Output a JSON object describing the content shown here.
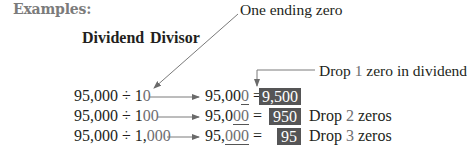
{
  "heading": "Examples:",
  "columns": {
    "dividend": "Dividend",
    "divisor": "Divisor"
  },
  "annotations": {
    "one_ending_zero": "One ending zero",
    "drop_one_prefix": "Drop ",
    "drop_one_number": "1",
    "drop_one_suffix": " zero in dividend"
  },
  "rows": [
    {
      "dividend": "95,000",
      "operator": "÷",
      "divisor_lead": "1",
      "divisor_zeros": "0",
      "result_prefix": "95,00",
      "result_underlined": "0",
      "equals": "=",
      "answer": "9,500",
      "note_prefix": "",
      "note_number": "",
      "note_suffix": ""
    },
    {
      "dividend": "95,000",
      "operator": "÷",
      "divisor_lead": "1",
      "divisor_zeros": "00",
      "result_prefix": "95,0",
      "result_underlined": "00",
      "equals": "=",
      "answer": "950",
      "note_prefix": "Drop ",
      "note_number": "2",
      "note_suffix": " zeros"
    },
    {
      "dividend": "95,000",
      "operator": "÷",
      "divisor_lead": "1,",
      "divisor_zeros": "000",
      "result_prefix": "95,",
      "result_underlined": "000",
      "equals": "=",
      "answer": "95",
      "note_prefix": "Drop ",
      "note_number": "3",
      "note_suffix": " zeros"
    }
  ],
  "colors": {
    "heading": "#7b7b7b",
    "text": "#231f20",
    "highlight_digit": "#6d6e70",
    "answer_box": "#555556",
    "arrow": "#7a7a7a"
  }
}
